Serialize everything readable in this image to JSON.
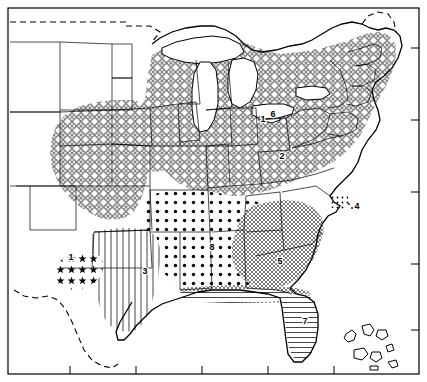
{
  "figure": {
    "kind": "distribution-map",
    "title": "",
    "region": "Eastern United States",
    "background_color": "#ffffff",
    "line_color": "#000000",
    "frame": {
      "present": true,
      "border_width_px": 1,
      "tick_marks": true,
      "tick_count_bottom": 6,
      "tick_count_right": 5
    }
  },
  "regions": [
    {
      "id": 1,
      "label": "1",
      "pattern": "star-dots",
      "pattern_name": "scattered star symbols",
      "fill_color": "#000000",
      "label_x": 71,
      "label_y": 258,
      "area_description": "central Texas"
    },
    {
      "id": 2,
      "label": "2",
      "pattern": "gray-lattice-diamond",
      "pattern_name": "gray diamond lattice",
      "fill_color": "#8a8a8a",
      "label_x": 282,
      "label_y": 157,
      "area_description": "Midwest, Great Lakes, Northeast, Appalachians, Great Plains"
    },
    {
      "id": 3,
      "label": "3",
      "pattern": "vertical-lines",
      "pattern_name": "vertical line hatching",
      "fill_color": "#555555",
      "label_x": 145,
      "label_y": 272,
      "area_description": "eastern Texas to Louisiana Gulf Coast"
    },
    {
      "id": 4,
      "label": "4",
      "pattern": "coastal-marker",
      "pattern_name": "fine stipple coastal strip",
      "fill_color": "#000000",
      "label_x": 357,
      "label_y": 207,
      "area_description": "North Carolina Outer Banks / coastal strip"
    },
    {
      "id": 5,
      "label": "5",
      "pattern": "fine-crosshatch",
      "pattern_name": "fine square crosshatch",
      "fill_color": "#6b6b6b",
      "label_x": 280,
      "label_y": 262,
      "area_description": "Georgia, South Carolina, southern Alabama"
    },
    {
      "id": 6,
      "label": "6",
      "pattern": "small-outline-area",
      "pattern_name": "small outlined area",
      "fill_color": "#ffffff",
      "label_x": 273,
      "label_y": 115,
      "area_description": "Lake Erie shore, northern Ohio"
    },
    {
      "id": 7,
      "label": "7",
      "pattern": "horizontal-lines",
      "pattern_name": "horizontal line hatching",
      "fill_color": "#444444",
      "label_x": 305,
      "label_y": 322,
      "area_description": "Florida peninsula and Gulf Coast strip"
    },
    {
      "id": 8,
      "label": "8",
      "pattern": "bold-dots",
      "pattern_name": "bold dot stipple",
      "fill_color": "#000000",
      "label_x": 212,
      "label_y": 248,
      "area_description": "Arkansas, Mississippi, Alabama, Tennessee, Kentucky lowlands"
    }
  ],
  "extra_labels": [
    {
      "text": "1",
      "x": 263,
      "y": 120,
      "note": "leader label by Lake Erie"
    }
  ],
  "map_features": {
    "state_boundaries": true,
    "coastline": true,
    "great_lakes": [
      "Lake Superior",
      "Lake Michigan",
      "Lake Huron",
      "Lake Erie",
      "Lake Ontario"
    ],
    "international_border_style": "dashed",
    "bahamas_islands": true
  }
}
